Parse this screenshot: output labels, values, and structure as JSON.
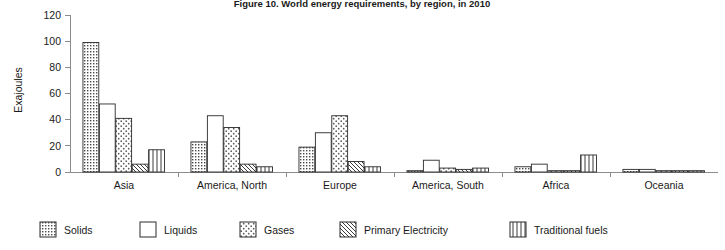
{
  "chart_data": {
    "type": "bar",
    "title": "Figure 10. World energy requirements, by region, in 2010",
    "xlabel": "",
    "ylabel": "Exajoules",
    "ylim": [
      0,
      120
    ],
    "yticks": [
      0,
      20,
      40,
      60,
      80,
      100,
      120
    ],
    "ytick_labels": [
      "0",
      "20",
      "40",
      "60",
      "80",
      "100",
      "120"
    ],
    "grid": false,
    "legend_position": "bottom",
    "categories": [
      "Asia",
      "America, North",
      "Europe",
      "America, South",
      "Africa",
      "Oceania"
    ],
    "series": [
      {
        "name": "Solids",
        "pattern": "dense-dots",
        "values": [
          99,
          23,
          19,
          1,
          4,
          2
        ]
      },
      {
        "name": "Liquids",
        "pattern": "solid-white",
        "values": [
          52,
          43,
          30,
          9,
          6,
          2
        ]
      },
      {
        "name": "Gases",
        "pattern": "sparse-dots",
        "values": [
          41,
          34,
          43,
          3,
          1,
          1
        ]
      },
      {
        "name": "Primary Electricity",
        "pattern": "diagonal-hatch",
        "values": [
          6,
          6,
          8,
          2,
          1,
          1
        ]
      },
      {
        "name": "Traditional fuels",
        "pattern": "vertical-lines",
        "values": [
          17,
          4,
          4,
          3,
          13,
          1
        ]
      }
    ]
  },
  "colors": {
    "axis": "#8c8c8c",
    "bar_outline": "#2b2b2b",
    "text": "#1a1a1a",
    "background": "#ffffff"
  }
}
